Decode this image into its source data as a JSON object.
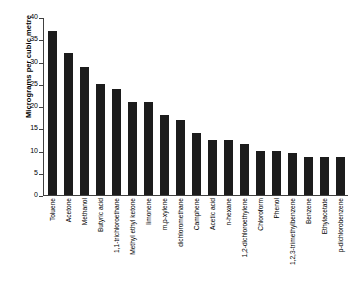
{
  "chart_data": {
    "type": "bar",
    "title": "",
    "xlabel": "",
    "ylabel": "Micrograms per cubic metre",
    "ylim": [
      0,
      40
    ],
    "yticks": [
      0,
      5,
      10,
      15,
      20,
      25,
      30,
      35,
      40
    ],
    "grid": false,
    "legend": false,
    "bar_color": "#1c1c1c",
    "axis_color": "#404040",
    "categories": [
      "Toluene",
      "Acetone",
      "Methanol",
      "Butyric acid",
      "1,1-trichloroethane",
      "Methyl ethyl ketone",
      "limonene",
      "m,p-xylene",
      "dichloromethane",
      "Camphene",
      "Acetic acid",
      "n-hexane",
      "1,2-dichloroethylene",
      "Chloroform",
      "Phenol",
      "1,2,3-trimethylbenzene",
      "Benzene",
      "Ethylacetate",
      "p-dichlorobenzene"
    ],
    "values": [
      37,
      32,
      29,
      25,
      24,
      21,
      21,
      18,
      17,
      14,
      12.5,
      12.5,
      11.5,
      10,
      10,
      9.5,
      8.5,
      8.5,
      8.5
    ]
  }
}
